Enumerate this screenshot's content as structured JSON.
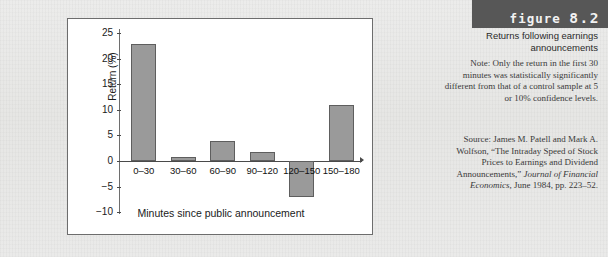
{
  "figure": {
    "banner_word": "figure",
    "banner_number": "8.2",
    "caption_title": "Returns following earnings announcements",
    "note": "Note: Only the return in the first 30 minutes was statistically significantly different from that of a control sample at 5 or 10% confidence levels.",
    "source_prefix": "Source: James M. Patell and Mark A. Wolfson, “The Intraday Speed of Stock Prices to Earnings and Dividend Announcements,” ",
    "source_journal": "Journal of Financial Economics",
    "source_suffix": ", June 1984, pp. 223–52."
  },
  "colors": {
    "bar_fill": "#9a9a9a",
    "bar_stroke": "#5e5e5e",
    "banner_bg": "#575757",
    "page_bg": "#e8e8e6",
    "panel_bg": "#ffffff"
  },
  "chart_data": {
    "type": "bar",
    "title": "",
    "xlabel": "Minutes since public announcement",
    "ylabel": "Return (%)",
    "categories": [
      "0–30",
      "30–60",
      "60–90",
      "90–120",
      "120–150",
      "150–180"
    ],
    "values": [
      22.8,
      0.8,
      4.0,
      1.7,
      -7.0,
      11.0
    ],
    "yticks": [
      25,
      20,
      15,
      10,
      5,
      0,
      -5,
      -10
    ],
    "yticklabels": [
      "25",
      "20",
      "15",
      "10",
      "5",
      "0",
      "−5",
      "−10"
    ],
    "ylim": [
      -10,
      25
    ],
    "grid": false,
    "legend": null
  }
}
